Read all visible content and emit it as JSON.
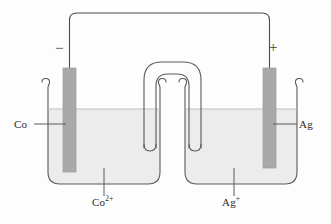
{
  "figure": {
    "type": "electrochemical-cell-diagram"
  },
  "colors": {
    "outline": "#4a4a4a",
    "electrode_fill": "#a9a9a9",
    "electrode_edge": "#8f8f8f",
    "solution_fill": "#ececec",
    "background": "#fdfdfd",
    "wire": "#4a4a4a",
    "text": "#2b2b2b"
  },
  "labels": {
    "left_electrode": "Co",
    "right_electrode": "Ag",
    "left_solution_ion": "Co",
    "left_solution_charge": "2+",
    "right_solution_ion": "Ag",
    "right_solution_charge": "+",
    "negative_terminal": "−",
    "positive_terminal": "+"
  },
  "components": {
    "left_beaker": "beaker containing Co2+ solution",
    "right_beaker": "beaker containing Ag+ solution",
    "salt_bridge": "inverted U-tube salt bridge",
    "external_wire": "external circuit wire connecting electrodes"
  }
}
